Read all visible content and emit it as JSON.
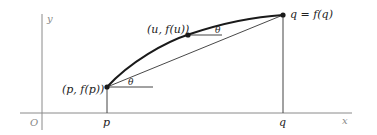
{
  "diagram": {
    "axes": {
      "origin_label": "O",
      "x_label": "x",
      "y_label": "y",
      "axis_color": "#8a8a8a"
    },
    "ticks": {
      "p_label": "p",
      "q_label": "q"
    },
    "points": {
      "p_point_label": "(p, f(p))",
      "u_point_label": "(u, f(u))",
      "q_point_label": "q = f(q)"
    },
    "angles": {
      "theta_at_p": "θ",
      "theta_at_u": "θ"
    },
    "colors": {
      "curve": "#1a1a1a",
      "chord": "#333333",
      "text": "#222222"
    }
  }
}
